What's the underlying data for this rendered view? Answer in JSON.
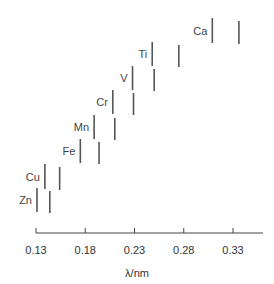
{
  "chart_data": {
    "type": "scatter",
    "title": "",
    "xlabel": "λ/nm",
    "ylabel": "",
    "xlim": [
      0.13,
      0.36
    ],
    "x_ticks": [
      "0.13",
      "0.18",
      "0.23",
      "0.28",
      "0.33"
    ],
    "grid": false,
    "legend": null,
    "series": [
      {
        "name": "Zn",
        "lines_nm": [
          0.131,
          0.144
        ]
      },
      {
        "name": "Cu",
        "lines_nm": [
          0.139,
          0.154
        ]
      },
      {
        "name": "Fe",
        "lines_nm": [
          0.175,
          0.194
        ]
      },
      {
        "name": "Mn",
        "lines_nm": [
          0.189,
          0.21
        ]
      },
      {
        "name": "Cr",
        "lines_nm": [
          0.208,
          0.229
        ]
      },
      {
        "name": "V",
        "lines_nm": [
          0.228,
          0.25
        ]
      },
      {
        "name": "Ti",
        "lines_nm": [
          0.248,
          0.275
        ]
      },
      {
        "name": "Ca",
        "lines_nm": [
          0.309,
          0.336
        ]
      }
    ]
  },
  "axis": {
    "label": "λ/nm"
  }
}
